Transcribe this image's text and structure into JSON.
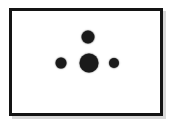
{
  "figure": {
    "type": "dot-diagram",
    "title": "",
    "background_color": "#ffffff",
    "frame": {
      "border_color": "#141414",
      "border_width_px": 3,
      "x": 9,
      "y": 8,
      "width": 154,
      "height": 108,
      "shadow_color": "#d8d8d8"
    },
    "dot_color": "#1a1a1a",
    "dot_count": 4,
    "arrangement": "diamond-like: one large center dot with one dot above, one left, one right",
    "dots": [
      {
        "id": "top",
        "label": "top dot",
        "cx": 88,
        "cy": 37,
        "diameter": 13,
        "size_rank": "medium"
      },
      {
        "id": "left",
        "label": "left dot",
        "cx": 61,
        "cy": 63,
        "diameter": 11,
        "size_rank": "small-medium"
      },
      {
        "id": "center",
        "label": "center dot",
        "cx": 89,
        "cy": 63,
        "diameter": 19,
        "size_rank": "large"
      },
      {
        "id": "right",
        "label": "right dot",
        "cx": 114,
        "cy": 63,
        "diameter": 10,
        "size_rank": "small"
      }
    ]
  },
  "chart_data": {
    "type": "scatter",
    "title": "",
    "xlabel": "",
    "ylabel": "",
    "grid": false,
    "legend": "none",
    "xlim": [
      9,
      163
    ],
    "ylim": [
      116,
      8
    ],
    "series": [
      {
        "name": "dots",
        "marker": "filled-circle",
        "color": "#1a1a1a",
        "points": [
          {
            "x": 88,
            "y": 37,
            "size": 13
          },
          {
            "x": 61,
            "y": 63,
            "size": 11
          },
          {
            "x": 89,
            "y": 63,
            "size": 19
          },
          {
            "x": 114,
            "y": 63,
            "size": 10
          }
        ]
      }
    ]
  }
}
